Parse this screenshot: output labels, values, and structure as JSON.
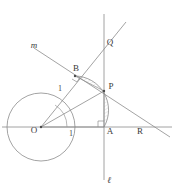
{
  "figure": {
    "kind": "geometry-diagram",
    "background_color": "#ffffff",
    "stroke_color": "#8a8a8a",
    "label_color": "#3a3a3a",
    "width": 182,
    "height": 195
  },
  "labels": {
    "origin": "O",
    "point_a": "A",
    "point_b": "B",
    "point_p": "P",
    "point_q": "Q",
    "point_r": "R",
    "line_m": "m",
    "line_l": "ℓ",
    "radius_ob": "1",
    "radius_oa": "1"
  },
  "geometry": {
    "circle": {
      "cx": 41,
      "cy": 127,
      "r": 34
    },
    "points": {
      "O": {
        "x": 41,
        "y": 127
      },
      "A": {
        "x": 104,
        "y": 127
      },
      "B": {
        "x": 75,
        "y": 76
      },
      "P": {
        "x": 104,
        "y": 91
      },
      "Q": {
        "x": 104,
        "y": 44
      },
      "R": {
        "x": 139,
        "y": 127
      }
    },
    "lines": {
      "horizontal_axis": {
        "x1": 2,
        "y1": 127,
        "x2": 172,
        "y2": 127
      },
      "vertical_line_l": {
        "x1": 104,
        "y1": 14,
        "x2": 104,
        "y2": 180
      },
      "line_m": {
        "x1": 34,
        "y1": 48,
        "x2": 170,
        "y2": 137
      },
      "ray_OQ": {
        "x1": 41,
        "y1": 127,
        "x2": 126,
        "y2": 22
      },
      "radius_OB_to_edge": {
        "x1": 41,
        "y1": 127,
        "x2": 75,
        "y2": 76
      },
      "segment_OP": {
        "x1": 41,
        "y1": 127,
        "x2": 104,
        "y2": 91
      },
      "segment_OA": {
        "x1": 41,
        "y1": 127,
        "x2": 104,
        "y2": 127
      }
    },
    "arcs": {
      "angle_arc_at_O": {
        "cx": 41,
        "cy": 127,
        "r": 26,
        "from_deg": 0,
        "to_deg": 56
      },
      "shaded_region": "curvilinear triangle B-P-arc"
    },
    "marks": {
      "right_angle_at_A": true,
      "right_angle_at_B": true
    }
  }
}
